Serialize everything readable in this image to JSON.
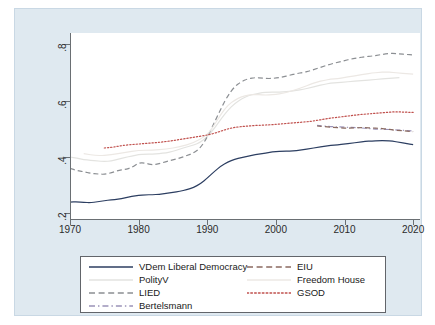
{
  "chart_data": {
    "type": "line",
    "title": "",
    "subtitle": "",
    "xlabel": "",
    "ylabel": "",
    "xlim": [
      1970,
      2021
    ],
    "ylim": [
      0.18,
      0.84
    ],
    "xticks": [
      "1970",
      "1980",
      "1990",
      "2000",
      "2010",
      "2020"
    ],
    "xtick_values": [
      1970,
      1980,
      1990,
      2000,
      2010,
      2020
    ],
    "yticks": [
      ".2",
      ".4",
      ".6",
      ".8"
    ],
    "ytick_values": [
      0.2,
      0.4,
      0.6,
      0.8
    ],
    "grid": false,
    "legend_position": "bottom",
    "series": [
      {
        "name": "VDem Liberal Democracy",
        "color": "#2c3e61",
        "style": "solid",
        "x": [
          1970,
          1971,
          1972,
          1973,
          1974,
          1975,
          1976,
          1977,
          1978,
          1979,
          1980,
          1981,
          1982,
          1983,
          1984,
          1985,
          1986,
          1987,
          1988,
          1989,
          1990,
          1991,
          1992,
          1993,
          1994,
          1995,
          1996,
          1997,
          1998,
          1999,
          2000,
          2001,
          2002,
          2003,
          2004,
          2005,
          2006,
          2007,
          2008,
          2009,
          2010,
          2011,
          2012,
          2013,
          2014,
          2015,
          2016,
          2017,
          2018,
          2019,
          2020
        ],
        "values": [
          0.24,
          0.241,
          0.239,
          0.238,
          0.241,
          0.245,
          0.248,
          0.25,
          0.255,
          0.26,
          0.264,
          0.266,
          0.266,
          0.268,
          0.271,
          0.274,
          0.278,
          0.284,
          0.292,
          0.305,
          0.325,
          0.348,
          0.368,
          0.382,
          0.392,
          0.398,
          0.403,
          0.408,
          0.412,
          0.416,
          0.42,
          0.42,
          0.421,
          0.423,
          0.426,
          0.43,
          0.434,
          0.438,
          0.441,
          0.443,
          0.446,
          0.449,
          0.452,
          0.455,
          0.457,
          0.458,
          0.458,
          0.456,
          0.452,
          0.448,
          0.444
        ]
      },
      {
        "name": "PolityV",
        "color": "#e3e3e0",
        "style": "solid",
        "x": [
          1970,
          1971,
          1972,
          1973,
          1974,
          1975,
          1976,
          1977,
          1978,
          1979,
          1980,
          1981,
          1982,
          1983,
          1984,
          1985,
          1986,
          1987,
          1988,
          1989,
          1990,
          1991,
          1992,
          1993,
          1994,
          1995,
          1996,
          1997,
          1998,
          1999,
          2000,
          2001,
          2002,
          2003,
          2004,
          2005,
          2006,
          2007,
          2008,
          2009,
          2010,
          2011,
          2012,
          2013,
          2014,
          2015,
          2016,
          2017,
          2018
        ],
        "values": [
          0.4,
          0.396,
          0.391,
          0.388,
          0.386,
          0.384,
          0.386,
          0.392,
          0.398,
          0.404,
          0.408,
          0.41,
          0.41,
          0.412,
          0.415,
          0.42,
          0.428,
          0.436,
          0.442,
          0.452,
          0.472,
          0.5,
          0.535,
          0.566,
          0.59,
          0.606,
          0.618,
          0.624,
          0.628,
          0.63,
          0.63,
          0.631,
          0.633,
          0.636,
          0.64,
          0.646,
          0.652,
          0.658,
          0.662,
          0.664,
          0.666,
          0.668,
          0.67,
          0.672,
          0.674,
          0.676,
          0.678,
          0.68,
          0.682
        ]
      },
      {
        "name": "LIED",
        "color": "#8c8f93",
        "style": "dashed",
        "x": [
          1970,
          1971,
          1972,
          1973,
          1974,
          1975,
          1976,
          1977,
          1978,
          1979,
          1980,
          1981,
          1982,
          1983,
          1984,
          1985,
          1986,
          1987,
          1988,
          1989,
          1990,
          1991,
          1992,
          1993,
          1994,
          1995,
          1996,
          1997,
          1998,
          1999,
          2000,
          2001,
          2002,
          2003,
          2004,
          2005,
          2006,
          2007,
          2008,
          2009,
          2010,
          2011,
          2012,
          2013,
          2014,
          2015,
          2016,
          2017,
          2018,
          2019,
          2020
        ],
        "values": [
          0.36,
          0.352,
          0.348,
          0.342,
          0.34,
          0.338,
          0.344,
          0.352,
          0.356,
          0.362,
          0.38,
          0.378,
          0.372,
          0.376,
          0.384,
          0.39,
          0.396,
          0.405,
          0.414,
          0.432,
          0.47,
          0.52,
          0.572,
          0.618,
          0.65,
          0.668,
          0.678,
          0.682,
          0.68,
          0.678,
          0.68,
          0.684,
          0.69,
          0.696,
          0.7,
          0.706,
          0.714,
          0.722,
          0.73,
          0.736,
          0.742,
          0.748,
          0.752,
          0.756,
          0.758,
          0.762,
          0.766,
          0.768,
          0.766,
          0.764,
          0.762
        ]
      },
      {
        "name": "Bertelsmann",
        "color": "#9a92b8",
        "style": "dashdot",
        "x": [
          2006,
          2008,
          2010,
          2012,
          2014,
          2016,
          2018,
          2020
        ],
        "values": [
          0.512,
          0.508,
          0.506,
          0.504,
          0.5,
          0.498,
          0.496,
          0.492
        ]
      },
      {
        "name": "EIU",
        "color": "#8a6a60",
        "style": "dashed",
        "x": [
          2006,
          2008,
          2010,
          2011,
          2012,
          2013,
          2014,
          2015,
          2016,
          2017,
          2018,
          2019,
          2020
        ],
        "values": [
          0.51,
          0.506,
          0.502,
          0.503,
          0.504,
          0.504,
          0.503,
          0.502,
          0.5,
          0.496,
          0.494,
          0.492,
          0.49
        ]
      },
      {
        "name": "Freedom House",
        "color": "#ece8e4",
        "style": "solid",
        "x": [
          1972,
          1974,
          1976,
          1978,
          1980,
          1982,
          1984,
          1986,
          1988,
          1990,
          1991,
          1992,
          1993,
          1994,
          1995,
          1996,
          1997,
          1998,
          1999,
          2000,
          2001,
          2002,
          2003,
          2004,
          2005,
          2006,
          2007,
          2008,
          2009,
          2010,
          2011,
          2012,
          2013,
          2014,
          2015,
          2016,
          2017,
          2018,
          2019,
          2020
        ],
        "values": [
          0.412,
          0.404,
          0.408,
          0.416,
          0.424,
          0.424,
          0.428,
          0.436,
          0.45,
          0.478,
          0.512,
          0.552,
          0.584,
          0.602,
          0.614,
          0.62,
          0.622,
          0.62,
          0.62,
          0.622,
          0.626,
          0.632,
          0.64,
          0.648,
          0.658,
          0.666,
          0.672,
          0.676,
          0.678,
          0.682,
          0.686,
          0.69,
          0.694,
          0.698,
          0.7,
          0.702,
          0.7,
          0.698,
          0.696,
          0.694
        ]
      },
      {
        "name": "GSOD",
        "color": "#c0504d",
        "style": "dotted",
        "x": [
          1975,
          1976,
          1977,
          1978,
          1979,
          1980,
          1981,
          1982,
          1983,
          1984,
          1985,
          1986,
          1987,
          1988,
          1989,
          1990,
          1991,
          1992,
          1993,
          1994,
          1995,
          1996,
          1997,
          1998,
          1999,
          2000,
          2001,
          2002,
          2003,
          2004,
          2005,
          2006,
          2007,
          2008,
          2009,
          2010,
          2011,
          2012,
          2013,
          2014,
          2015,
          2016,
          2017,
          2018,
          2019,
          2020
        ],
        "values": [
          0.432,
          0.434,
          0.438,
          0.442,
          0.444,
          0.446,
          0.448,
          0.45,
          0.452,
          0.455,
          0.458,
          0.462,
          0.466,
          0.47,
          0.474,
          0.478,
          0.484,
          0.492,
          0.5,
          0.505,
          0.508,
          0.51,
          0.512,
          0.513,
          0.514,
          0.516,
          0.518,
          0.52,
          0.522,
          0.524,
          0.526,
          0.53,
          0.534,
          0.538,
          0.541,
          0.544,
          0.547,
          0.55,
          0.552,
          0.554,
          0.556,
          0.558,
          0.56,
          0.56,
          0.559,
          0.558
        ]
      }
    ]
  },
  "legend": {
    "entries": [
      {
        "label": "VDem Liberal Democracy",
        "key": "line-solid-navy"
      },
      {
        "label": "PolityV",
        "key": "line-solid-lightgrey"
      },
      {
        "label": "LIED",
        "key": "line-dashed-grey"
      },
      {
        "label": "Bertelsmann",
        "key": "line-dashdot-purple"
      },
      {
        "label": "EIU",
        "key": "line-dashed-brown"
      },
      {
        "label": "Freedom House",
        "key": "line-solid-offwhite"
      },
      {
        "label": "GSOD",
        "key": "line-dotted-red"
      }
    ]
  },
  "colors": {
    "background": "#dfe9f0",
    "plot_background": "#ffffff",
    "axis": "#6a6f73",
    "text": "#2b2b2b"
  }
}
